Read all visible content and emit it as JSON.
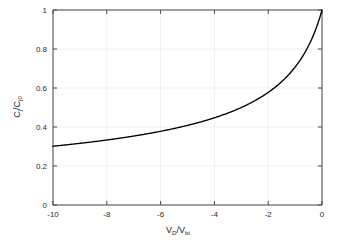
{
  "chart_data": {
    "type": "line",
    "title": "",
    "subtitle": "",
    "xlabel": "V_D/V_bi",
    "xlabel_main": "V",
    "xlabel_sub1": "D",
    "xlabel_slash": "/V",
    "xlabel_sub2": "bi",
    "ylabel": "C_j/C_j0",
    "ylabel_main": "C",
    "ylabel_sub1": "j",
    "ylabel_slash": "/C",
    "ylabel_sub2": "j0",
    "xlim": [
      -10,
      0
    ],
    "ylim": [
      0,
      1
    ],
    "xticks": [
      -10,
      -8,
      -6,
      -4,
      -2,
      0
    ],
    "xticklabels": [
      "-10",
      "-8",
      "-6",
      "-4",
      "-2",
      "0"
    ],
    "yticks": [
      0,
      0.2,
      0.4,
      0.6,
      0.8,
      1
    ],
    "yticklabels": [
      "0",
      "0.2",
      "0.4",
      "0.6",
      "0.8",
      "1"
    ],
    "grid": true,
    "legend": null,
    "legend_position": "none",
    "series": [
      {
        "name": "Cj/Cj0",
        "color": "#000000",
        "equation": "1/sqrt(1 - V)",
        "x": [
          -10.0,
          -9.8,
          -9.6,
          -9.4,
          -9.2,
          -9.0,
          -8.8,
          -8.6,
          -8.4,
          -8.2,
          -8.0,
          -7.8,
          -7.6,
          -7.4,
          -7.2,
          -7.0,
          -6.8,
          -6.6,
          -6.4,
          -6.2,
          -6.0,
          -5.8,
          -5.6,
          -5.4,
          -5.2,
          -5.0,
          -4.8,
          -4.6,
          -4.4,
          -4.2,
          -4.0,
          -3.8,
          -3.6,
          -3.4,
          -3.2,
          -3.0,
          -2.8,
          -2.6,
          -2.4,
          -2.2,
          -2.0,
          -1.8,
          -1.6,
          -1.4,
          -1.2,
          -1.0,
          -0.9,
          -0.8,
          -0.7,
          -0.6,
          -0.5,
          -0.4,
          -0.3,
          -0.2,
          -0.1,
          0.0
        ],
        "y": [
          0.3015,
          0.3038,
          0.3062,
          0.3086,
          0.311,
          0.3162,
          0.3162,
          0.3189,
          0.3216,
          0.3244,
          0.3333,
          0.3304,
          0.3333,
          0.3363,
          0.3395,
          0.3536,
          0.346,
          0.3494,
          0.3529,
          0.3566,
          0.378,
          0.3641,
          0.368,
          0.3721,
          0.3763,
          0.4082,
          0.3851,
          0.3897,
          0.3944,
          0.3993,
          0.4472,
          0.4096,
          0.4152,
          0.4209,
          0.427,
          0.5,
          0.4402,
          0.4472,
          0.4545,
          0.4623,
          0.5774,
          0.4781,
          0.4867,
          0.4961,
          0.506,
          0.7071,
          0.5394,
          0.5509,
          0.5634,
          0.5774,
          0.8165,
          0.6108,
          0.6313,
          0.6558,
          0.686,
          1.0
        ]
      }
    ],
    "plot_box": {
      "left": 53,
      "top": 10,
      "right": 322,
      "bottom": 205
    }
  },
  "colors": {
    "background": "#ffffff",
    "axis": "#4a4a4a",
    "grid": "#f0f0f0",
    "curve": "#000000",
    "text": "#1a1a1a"
  }
}
